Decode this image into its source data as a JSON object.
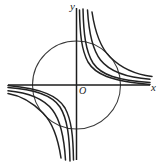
{
  "figure": {
    "background_color": "#ffffff",
    "stroke_color": "#222222",
    "axis_color": "#1d1d1d",
    "circle_color": "#3a3a3a",
    "labels": {
      "y_axis": "y",
      "x_axis": "x",
      "origin": "O"
    },
    "axes": {
      "origin_px": [
        76.5,
        85
      ],
      "x_axis_from_px": [
        8,
        85
      ],
      "x_axis_to_px": [
        150,
        85
      ],
      "y_axis_from_px": [
        76.5,
        8
      ],
      "y_axis_to_px": [
        76.5,
        160
      ]
    },
    "circle": {
      "center_px": [
        76.5,
        85
      ],
      "radius_px": 44
    }
  },
  "chart_data": {
    "type": "line",
    "title": "",
    "xlabel": "x",
    "ylabel": "y",
    "grid": false,
    "legend": false,
    "xlim": [
      -4.8,
      4.8
    ],
    "ylim": [
      -4.8,
      4.8
    ],
    "annotations": [
      {
        "text": "O",
        "x": 0,
        "y": 0,
        "role": "origin-label"
      },
      {
        "text": "x",
        "x": 4.6,
        "y": 0,
        "role": "axis-label"
      },
      {
        "text": "y",
        "x": 0,
        "y": 4.6,
        "role": "axis-label"
      }
    ],
    "shapes": [
      {
        "kind": "circle",
        "cx": 0,
        "cy": 0,
        "r": 1.5
      }
    ],
    "series": [
      {
        "name": "branch-ur-1",
        "family": "y = k/x",
        "k": 0.42,
        "quadrant": "I",
        "path_px": "M 79.5,10 C 79.9,34 81.5,50 88,62 C 95,74 110,81 150,84.4"
      },
      {
        "name": "branch-ur-2",
        "family": "y = k/x",
        "k": 0.72,
        "quadrant": "I",
        "path_px": "M 83,9 C 83.6,34 85.6,51 93,63 C 101,75 118,80.6 150,82.4"
      },
      {
        "name": "branch-ur-3",
        "family": "y = k/x",
        "k": 1.25,
        "quadrant": "I",
        "path_px": "M 87.5,10 C 88.8,32 92,49 100.5,60 C 110,72 126,77.5 150,79.2"
      },
      {
        "name": "branch-ur-4",
        "family": "y = k/x",
        "k": 2.0,
        "quadrant": "I",
        "path_px": "M 92,12 C 95,32 100,47 110,57 C 121,68 136,74.5 152,76.5"
      },
      {
        "name": "branch-ll-1",
        "family": "y = k/x",
        "k": 0.42,
        "quadrant": "III",
        "path_px": "M 73.5,160 C 73.1,136 71.5,120 65,108 C 58,96 43,89 8,85.6"
      },
      {
        "name": "branch-ll-2",
        "family": "y = k/x",
        "k": 0.72,
        "quadrant": "III",
        "path_px": "M 70,161 C 69.4,136 67.4,119 60,107 C 52,95 35,89.4 8,87.6"
      },
      {
        "name": "branch-ll-3",
        "family": "y = k/x",
        "k": 1.25,
        "quadrant": "III",
        "path_px": "M 65.5,160 C 64.2,138 61,121 52.5,110 C 43,98 27,92.5 8,90.8"
      },
      {
        "name": "branch-ll-4",
        "family": "y = k/x",
        "k": 2.0,
        "quadrant": "III",
        "path_px": "M 61,158 C 58,138 53,123 43,113 C 32,102 20,95.5 8,93.5"
      }
    ]
  }
}
